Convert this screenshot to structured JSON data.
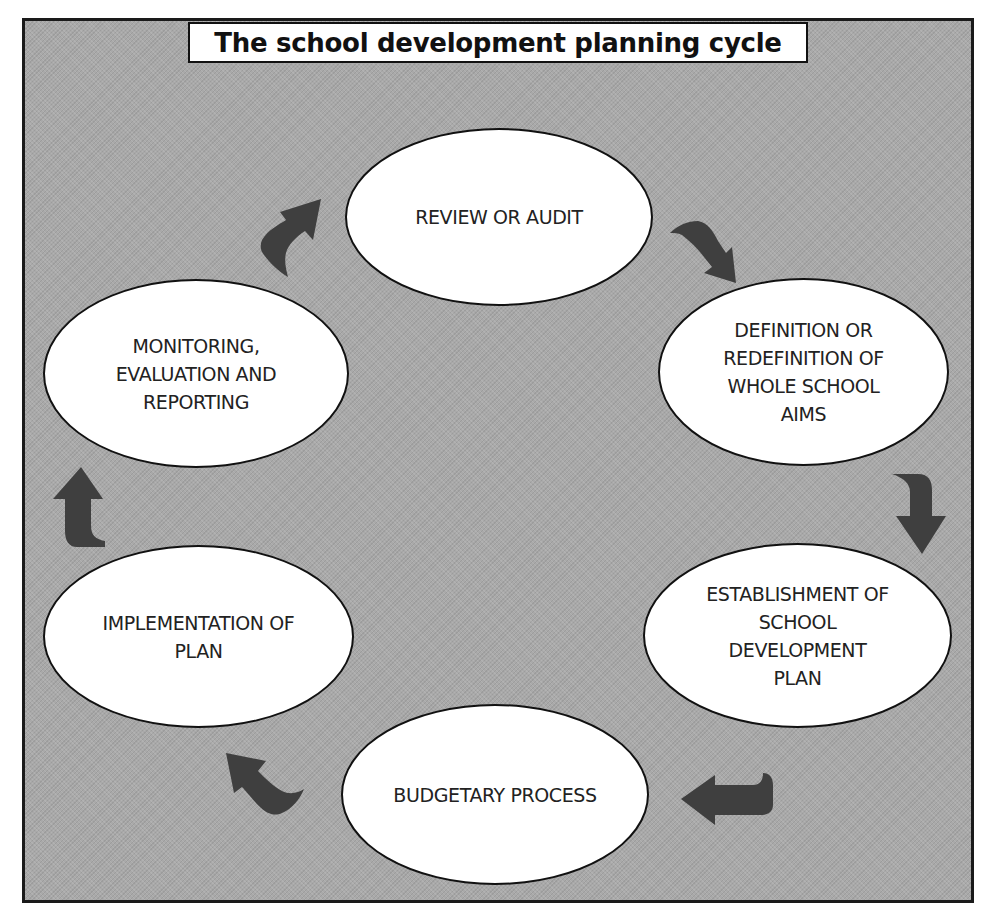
{
  "diagram": {
    "title": "The school development planning cycle",
    "type": "cycle",
    "colors": {
      "background": "#a9a9a9",
      "node_fill": "#ffffff",
      "node_border": "#111111",
      "arrow": "#3f3f3f",
      "text": "#222222"
    },
    "nodes": [
      {
        "id": "review",
        "label": "REVIEW OR AUDIT"
      },
      {
        "id": "definition",
        "label": "DEFINITION OR\nREDEFINITION OF\nWHOLE SCHOOL\nAIMS"
      },
      {
        "id": "establishment",
        "label": "ESTABLISHMENT OF\nSCHOOL\nDEVELOPMENT\nPLAN"
      },
      {
        "id": "budgetary",
        "label": "BUDGETARY PROCESS"
      },
      {
        "id": "implementation",
        "label": "IMPLEMENTATION OF\nPLAN"
      },
      {
        "id": "monitoring",
        "label": "MONITORING,\nEVALUATION AND\nREPORTING"
      }
    ],
    "edges": [
      {
        "from": "review",
        "to": "definition",
        "direction": "clockwise"
      },
      {
        "from": "definition",
        "to": "establishment",
        "direction": "clockwise"
      },
      {
        "from": "establishment",
        "to": "budgetary",
        "direction": "clockwise"
      },
      {
        "from": "budgetary",
        "to": "implementation",
        "direction": "clockwise"
      },
      {
        "from": "implementation",
        "to": "monitoring",
        "direction": "clockwise"
      },
      {
        "from": "monitoring",
        "to": "review",
        "direction": "clockwise"
      }
    ]
  }
}
